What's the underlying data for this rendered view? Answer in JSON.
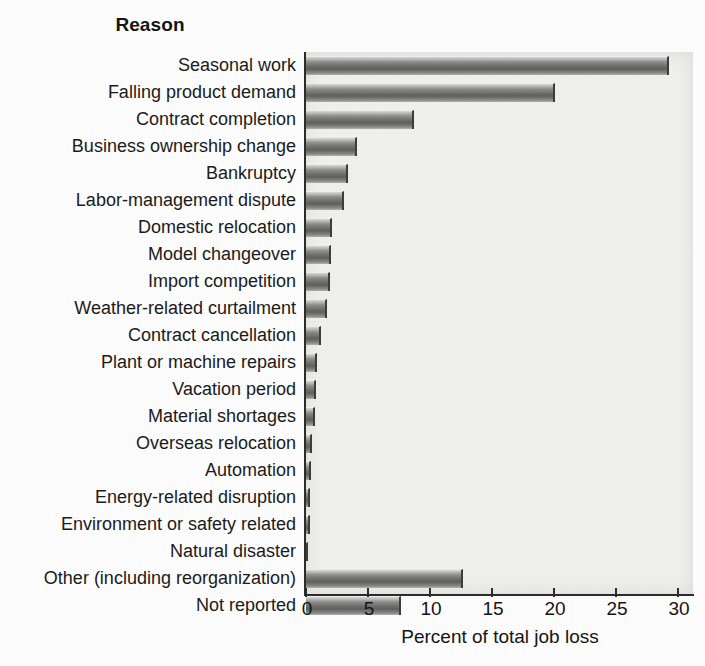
{
  "chart_data": {
    "type": "bar",
    "orientation": "horizontal",
    "title": "",
    "ylabel": "Reason",
    "xlabel": "Percent of total job loss",
    "xlim": [
      0,
      30
    ],
    "xticks": [
      0,
      5,
      10,
      15,
      20,
      25,
      30
    ],
    "grid": false,
    "legend": null,
    "categories": [
      "Seasonal work",
      "Falling product demand",
      "Contract completion",
      "Business ownership change",
      "Bankruptcy",
      "Labor-management dispute",
      "Domestic relocation",
      "Model changeover",
      "Import competition",
      "Weather-related curtailment",
      "Contract cancellation",
      "Plant or machine repairs",
      "Vacation period",
      "Material shortages",
      "Overseas relocation",
      "Automation",
      "Energy-related disruption",
      "Environment or safety related",
      "Natural disaster",
      "Other (including reorganization)",
      "Not reported"
    ],
    "values": [
      29.3,
      20.1,
      8.7,
      4.1,
      3.4,
      3.1,
      2.1,
      2.0,
      1.9,
      1.7,
      1.2,
      0.9,
      0.8,
      0.7,
      0.5,
      0.4,
      0.3,
      0.3,
      0.2,
      12.7,
      7.7
    ],
    "bar_color": "#6f6f6d",
    "panel_color": "#f0f0ee",
    "axis_color": "#2c2c2c"
  }
}
